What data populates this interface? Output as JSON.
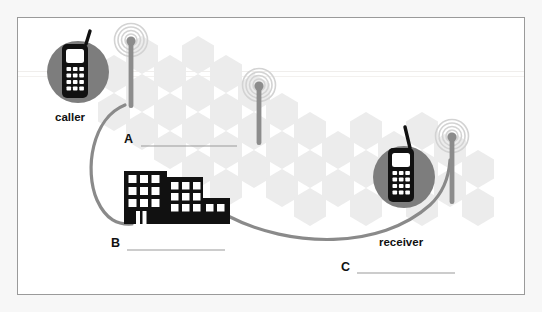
{
  "figure": {
    "type": "cellular-network-diagram",
    "title_visible": false,
    "background_pattern": "hexagon-honeycomb",
    "frame": {
      "style": "thin-gray-rectangle",
      "color": "#9a9a9a"
    }
  },
  "labels": {
    "caller": "caller",
    "receiver": "receiver",
    "blank_a": "A",
    "blank_b": "B",
    "blank_c": "C"
  },
  "blanks": [
    {
      "id": "A",
      "letter": "A",
      "answer": ""
    },
    {
      "id": "B",
      "letter": "B",
      "answer": ""
    },
    {
      "id": "C",
      "letter": "C",
      "answer": ""
    }
  ],
  "nodes": [
    {
      "name": "caller-phone",
      "icon": "mobile-phone-icon",
      "label": "caller"
    },
    {
      "name": "tower-a",
      "icon": "cell-tower-icon",
      "blank": "A"
    },
    {
      "name": "tower-middle",
      "icon": "cell-tower-icon"
    },
    {
      "name": "switching-center",
      "icon": "office-building-icon",
      "blank": "B"
    },
    {
      "name": "tower-c",
      "icon": "cell-tower-icon",
      "blank": "C"
    },
    {
      "name": "receiver-phone",
      "icon": "mobile-phone-icon",
      "label": "receiver"
    }
  ],
  "connections": [
    {
      "from": "caller-phone",
      "to": "switching-center",
      "style": "gray-curve"
    },
    {
      "from": "switching-center",
      "to": "tower-c",
      "style": "gray-curve"
    }
  ],
  "colors": {
    "phone_body": "#111111",
    "phone_circle": "#7d7d7d",
    "tower": "#8c8c8c",
    "building": "#111111",
    "curve": "#8a8a8a",
    "blank_line": "#9a9a9a",
    "hexagon": "#ececec",
    "page_background": "#f7f7f7",
    "inner_background": "#ffffff"
  }
}
